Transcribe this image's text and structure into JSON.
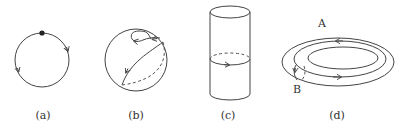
{
  "figure": {
    "panels": [
      {
        "id": "a",
        "caption": "(a)",
        "shape": "circle",
        "description": "circle with a base point and two orientation arrows"
      },
      {
        "id": "b",
        "caption": "(b)",
        "shape": "sphere",
        "description": "sphere with a small contractible loop and a great-circle loop (back half dashed)"
      },
      {
        "id": "c",
        "caption": "(c)",
        "shape": "cylinder",
        "description": "cylinder with an oriented loop around its waist (back half dashed)"
      },
      {
        "id": "d",
        "caption": "(d)",
        "shape": "torus",
        "description": "torus with loop A around the hole and loop B through the tube"
      }
    ],
    "torus_labels": {
      "A": "A",
      "B": "B"
    },
    "colors": {
      "stroke": "#444444",
      "text": "#333333",
      "background": "#ffffff"
    }
  }
}
